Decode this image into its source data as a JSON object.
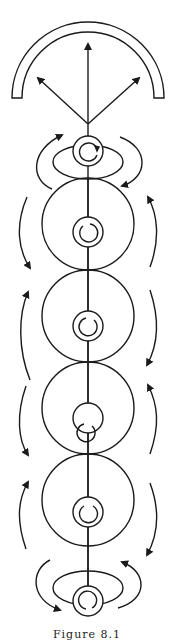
{
  "figure": {
    "caption": "Figure 8.1",
    "stroke_color": "#1a1a1a",
    "background": "#ffffff"
  },
  "elements": {
    "receiver_arc": "semicircular-shield",
    "emission_arrows": [
      "arrow-up",
      "arrow-up-left",
      "arrow-up-right"
    ],
    "top_coil": {
      "type": "small-ring-with-spiral",
      "loop": "ellipse"
    },
    "large_circles": [
      {
        "index": 1,
        "inner": "small-ring-with-spiral"
      },
      {
        "index": 2,
        "inner": "small-ring-with-spiral"
      },
      {
        "index": 3,
        "inner": "small-ring-with-spiral"
      },
      {
        "index": 4,
        "inner": "small-ring-with-spiral"
      }
    ],
    "bottom_coil": {
      "type": "small-ring-with-spiral",
      "loop": "ellipse"
    },
    "side_arrows_left": [
      "up",
      "down",
      "up",
      "down",
      "up",
      "down"
    ],
    "side_arrows_right": [
      "down",
      "up",
      "down",
      "up",
      "down",
      "up"
    ]
  }
}
